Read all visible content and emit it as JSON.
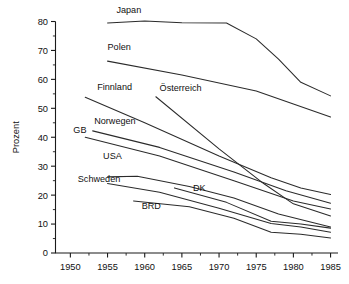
{
  "chart_data": {
    "type": "line",
    "title": "",
    "xlabel": "",
    "ylabel": "Prozent",
    "xlim": [
      1948,
      1986
    ],
    "ylim": [
      0,
      80
    ],
    "grid": false,
    "legend_position": "inline-labels",
    "x_ticks": [
      1950,
      1955,
      1960,
      1965,
      1970,
      1975,
      1980,
      1985
    ],
    "y_ticks": [
      0,
      10,
      20,
      30,
      40,
      50,
      60,
      70,
      80
    ],
    "x_minor_step": 2.5,
    "y_minor_step": 5,
    "series": [
      {
        "name": "Japan",
        "label_x": 1956.2,
        "label_y": 83.0,
        "x": [
          1955,
          1960,
          1965,
          1971,
          1975,
          1978,
          1981,
          1985
        ],
        "values": [
          79.5,
          80.2,
          79.6,
          79.5,
          74.0,
          67.0,
          59.0,
          54.3
        ]
      },
      {
        "name": "Polen",
        "label_x": 1955.0,
        "label_y": 70.0,
        "x": [
          1955,
          1965,
          1975,
          1980,
          1985
        ],
        "values": [
          66.3,
          61.5,
          56.0,
          51.5,
          47.0
        ]
      },
      {
        "name": "Finnland",
        "label_x": 1953.6,
        "label_y": 56.5,
        "x": [
          1952,
          1960,
          1970,
          1977,
          1981,
          1985
        ],
        "values": [
          53.8,
          45.0,
          33.5,
          26.0,
          22.5,
          20.2
        ]
      },
      {
        "name": "Österreich",
        "label_x": 1962.0,
        "label_y": 56.0,
        "x": [
          1961.5,
          1970,
          1976,
          1980,
          1985
        ],
        "values": [
          54.0,
          36.0,
          24.0,
          17.0,
          12.8
        ]
      },
      {
        "name": "Norwegen",
        "label_x": 1953.2,
        "label_y": 44.5,
        "x": [
          1953,
          1962,
          1972,
          1979,
          1985
        ],
        "values": [
          42.2,
          36.5,
          28.0,
          21.5,
          17.2
        ]
      },
      {
        "name": "GB",
        "label_x": 1950.4,
        "label_y": 41.5,
        "x": [
          1952,
          1962,
          1972,
          1980,
          1985
        ],
        "values": [
          40.0,
          33.5,
          25.0,
          18.0,
          15.2
        ]
      },
      {
        "name": "USA",
        "label_x": 1954.4,
        "label_y": 32.5,
        "x": [
          1955,
          1959,
          1966,
          1972,
          1978,
          1985
        ],
        "values": [
          26.3,
          26.5,
          23.0,
          19.0,
          13.5,
          9.0
        ]
      },
      {
        "name": "Schweden",
        "label_x": 1951.0,
        "label_y": 24.5,
        "x": [
          1955,
          1962,
          1970,
          1977,
          1981,
          1985
        ],
        "values": [
          24.0,
          21.0,
          15.5,
          10.2,
          9.0,
          7.2
        ]
      },
      {
        "name": "DK",
        "label_x": 1966.5,
        "label_y": 21.5,
        "x": [
          1964,
          1971,
          1977,
          1981,
          1985
        ],
        "values": [
          22.5,
          17.5,
          11.0,
          10.0,
          8.6
        ]
      },
      {
        "name": "BRD",
        "label_x": 1959.6,
        "label_y": 15.3,
        "x": [
          1958.5,
          1966,
          1972,
          1977,
          1981,
          1985
        ],
        "values": [
          18.0,
          16.0,
          12.0,
          7.2,
          6.5,
          5.2
        ]
      }
    ]
  }
}
